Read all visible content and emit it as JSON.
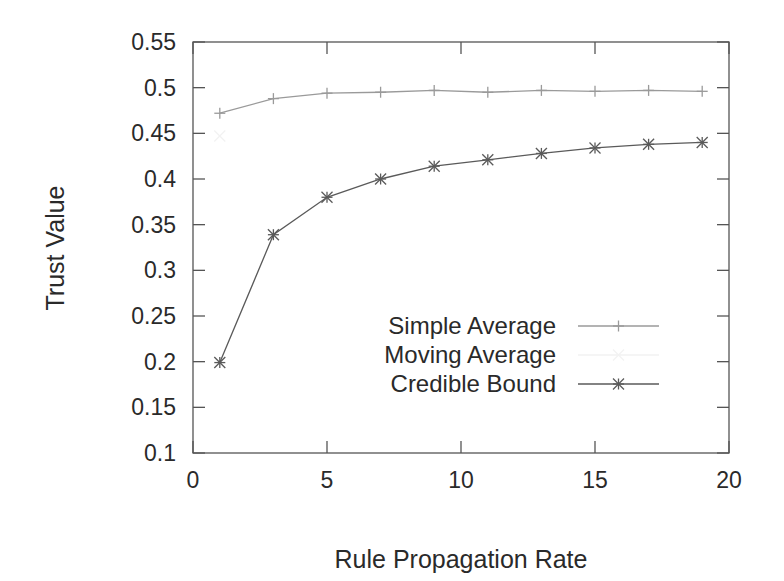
{
  "chart_data": {
    "type": "line",
    "title": "",
    "xlabel": "Rule Propagation Rate",
    "ylabel": "Trust Value",
    "xlim": [
      0,
      20
    ],
    "ylim": [
      0.1,
      0.55
    ],
    "xticks": [
      0,
      5,
      10,
      15,
      20
    ],
    "xtick_labels": [
      "0",
      "5",
      "10",
      "15",
      "20"
    ],
    "yticks": [
      0.1,
      0.15,
      0.2,
      0.25,
      0.3,
      0.35,
      0.4,
      0.45,
      0.5,
      0.55
    ],
    "ytick_labels": [
      "0.1",
      "0.15",
      "0.2",
      "0.25",
      "0.3",
      "0.35",
      "0.4",
      "0.45",
      "0.5",
      "0.55"
    ],
    "grid": false,
    "legend_position": "lower right (inside)",
    "x": [
      1,
      3,
      5,
      7,
      9,
      11,
      13,
      15,
      17,
      19
    ],
    "series": [
      {
        "name": "Simple Average",
        "marker": "plus",
        "color": "#9a9a9a",
        "values": [
          0.472,
          0.488,
          0.494,
          0.495,
          0.497,
          0.495,
          0.497,
          0.496,
          0.497,
          0.496
        ]
      },
      {
        "name": "Moving Average",
        "marker": "x",
        "color": "#f2f2f2",
        "values": [
          0.447,
          null,
          null,
          null,
          null,
          null,
          null,
          null,
          null,
          null
        ]
      },
      {
        "name": "Credible Bound",
        "marker": "star",
        "color": "#5a5a5a",
        "values": [
          0.199,
          0.339,
          0.38,
          0.4,
          0.414,
          0.421,
          0.428,
          0.434,
          0.438,
          0.44
        ]
      }
    ]
  }
}
